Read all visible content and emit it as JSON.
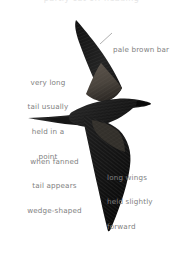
{
  "plate": {
    "subject": "dark petrel in flight",
    "background_color": "#ffffff",
    "label_color": "#808080",
    "bird_color": "#1a1a1a",
    "header_cutoff_text": "partly cut off heading"
  },
  "annotations": [
    {
      "id": "pale-brown-bar",
      "text": "pale brown bar",
      "lines": [
        "pale brown bar"
      ],
      "position": "upper-right",
      "has_leader_line": true
    },
    {
      "id": "long-tail",
      "text": "very long tail usually held in a point",
      "lines": [
        "very long",
        "tail usually",
        "held in a",
        "point"
      ],
      "position": "left",
      "has_leader_line": false
    },
    {
      "id": "wedge-tail",
      "text": "when fanned tail appears wedge-shaped",
      "lines": [
        "when fanned",
        "tail appears",
        "wedge-shaped"
      ],
      "position": "lower-left",
      "has_leader_line": false
    },
    {
      "id": "long-wings",
      "text": "long wings held slightly forward",
      "lines": [
        "long wings",
        "held slightly",
        "forward"
      ],
      "position": "lower-right",
      "has_leader_line": false
    }
  ]
}
